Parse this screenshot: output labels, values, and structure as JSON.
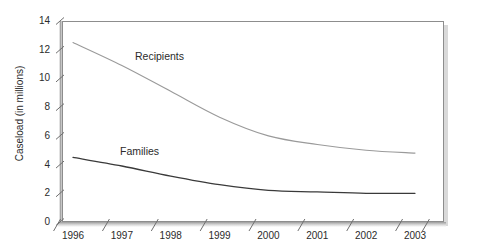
{
  "chart_data": {
    "type": "line",
    "title": "",
    "xlabel": "",
    "ylabel": "Caseload (in millions)",
    "x": [
      1996,
      1997,
      1998,
      1999,
      2000,
      2001,
      2002,
      2003
    ],
    "xtick_labels": [
      "1996",
      "1997",
      "1998",
      "1999",
      "2000",
      "2001",
      "2002",
      "2003"
    ],
    "ytick_labels": [
      "0",
      "2",
      "4",
      "6",
      "8",
      "10",
      "12",
      "14"
    ],
    "ytick_values": [
      0,
      2,
      4,
      6,
      8,
      10,
      12,
      14
    ],
    "ylim": [
      0,
      14
    ],
    "xlim": [
      1996,
      2003
    ],
    "grid": false,
    "legend_position": "inline-labels",
    "series": [
      {
        "name": "Recipients",
        "label": "Recipients",
        "color": "#9a9a9a",
        "values": [
          12.5,
          10.9,
          9.1,
          7.3,
          6.0,
          5.4,
          5.0,
          4.8
        ]
      },
      {
        "name": "Families",
        "label": "Families",
        "color": "#3a3a3a",
        "values": [
          4.5,
          3.9,
          3.2,
          2.6,
          2.2,
          2.1,
          2.0,
          2.0
        ]
      }
    ]
  },
  "colors": {
    "background": "#ffffff",
    "frame_border": "#8d8d8d",
    "frame_shadow": "#b9b9b9",
    "text": "#2b2b2b",
    "recipients_line": "#9a9a9a",
    "families_line": "#3a3a3a"
  }
}
